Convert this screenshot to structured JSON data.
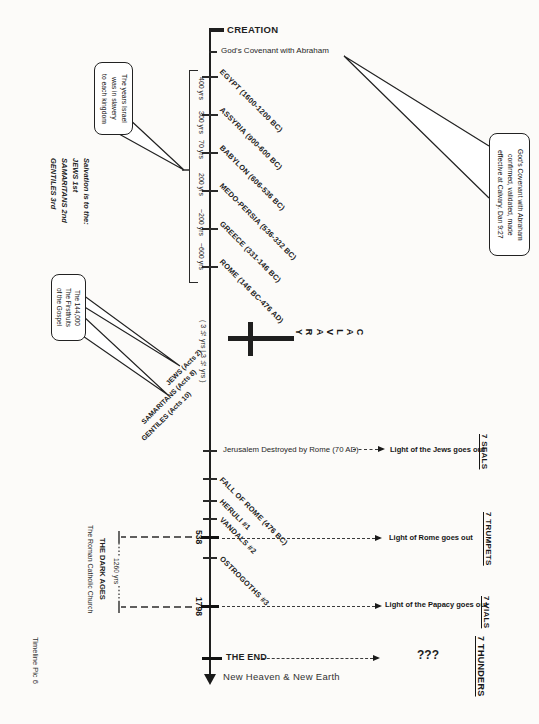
{
  "page": {
    "footer": "Timeline Pic 6"
  },
  "colors": {
    "ink": "#1f1f1f",
    "paper": "#fcfbf9"
  },
  "timeline": {
    "creation": "CREATION",
    "covenant": "God's Covenant with Abraham",
    "empires": [
      {
        "name": "EGYPT (1600-1200 BC)",
        "duration": "400 yrs"
      },
      {
        "name": "ASSYRIA (900-600 BC)",
        "duration": "300 yrs"
      },
      {
        "name": "BABYLON (606-536 BC)",
        "duration": "70 yrs"
      },
      {
        "name": "MEDO-PERSIA (536-332 BC)",
        "duration": "200 yrs"
      },
      {
        "name": "GREECE (331-146 BC)",
        "duration": "~200 yrs"
      },
      {
        "name": "ROME (146 BC-476 AD)",
        "duration": "~600 yrs"
      }
    ],
    "calvary": {
      "word": "CALVARY",
      "spans": "(  3 ½ yrs  |  3 ½ yrs  )"
    },
    "groups": [
      "JEWS (Acts 2)",
      "SAMARITANS (Acts 8)",
      "GENTILES (Acts 10)"
    ],
    "jerusalem": {
      "label": "Jerusalem Destroyed by Rome (70 AD)",
      "result": "Light of the Jews goes out",
      "series": "7 SEALS"
    },
    "barbarians": [
      "FALL OF ROME (476 BC)",
      "HERULI #1",
      "VANDALS #2",
      "OSTROGOTHS #3"
    ],
    "rome_fall": {
      "date": "538",
      "result": "Light of Rome goes out",
      "series": "7 TRUMPETS"
    },
    "papacy": {
      "date": "1798",
      "result": "Light of the Papacy goes out",
      "series": "7 VIALS"
    },
    "dark_ages": {
      "span": "1260 yrs",
      "title": "THE DARK AGES",
      "subtitle": "The Roman Catholic Church"
    },
    "end": {
      "label": "THE END",
      "result": "???",
      "series": "7 THUNDERS",
      "after": "New Heaven & New Earth"
    }
  },
  "callouts": {
    "slavery": {
      "lines": [
        "The years Israel",
        "was in slavery",
        "to each kingdom"
      ]
    },
    "firstfruits": {
      "lines": [
        "The 144,000",
        "The Firstfruits",
        "of the Gospel"
      ]
    },
    "covenant_confirmed": {
      "lines": [
        "God's Covenant with Abraham",
        "confirmed, validated, made",
        "effective at Calvary.  Dan 9:27"
      ]
    }
  },
  "salvation": {
    "lines": [
      "Salvation is to the:",
      "JEWS 1st",
      "SAMARITANS 2nd",
      "GENTILES 3rd"
    ]
  }
}
